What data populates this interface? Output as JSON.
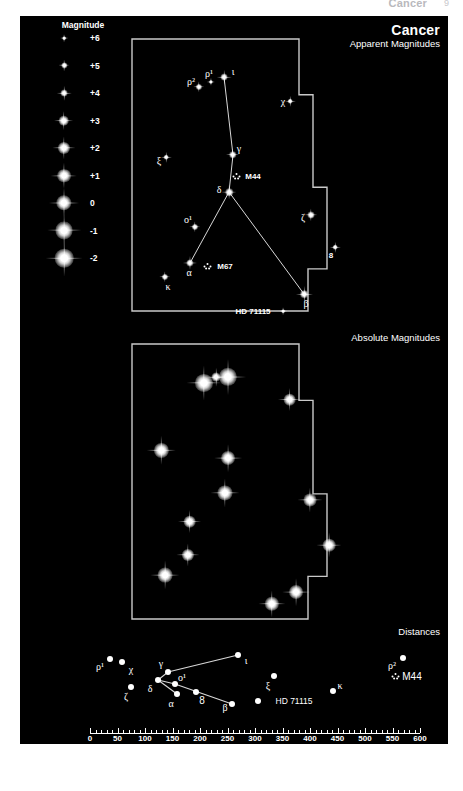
{
  "page_header": {
    "title": "Cancer",
    "page_number": "9"
  },
  "legend": {
    "title": "Magnitude",
    "rows": [
      {
        "label": "+6",
        "mag": 6
      },
      {
        "label": "+5",
        "mag": 5
      },
      {
        "label": "+4",
        "mag": 4
      },
      {
        "label": "+3",
        "mag": 3
      },
      {
        "label": "+2",
        "mag": 2
      },
      {
        "label": "+1",
        "mag": 1
      },
      {
        "label": "0",
        "mag": 0
      },
      {
        "label": "-1",
        "mag": -1
      },
      {
        "label": "-2",
        "mag": -2
      }
    ]
  },
  "titles": {
    "constellation": "Cancer",
    "panel_apparent": "Apparent Magnitudes",
    "panel_absolute": "Absolute Magnitudes",
    "panel_distances": "Distances"
  },
  "chart_data": {
    "type": "scatter",
    "title": "Cancer",
    "subtitle": "Apparent Magnitudes, Absolute Magnitudes and Distances",
    "panels": [
      {
        "name": "apparent_magnitudes",
        "title": "Apparent Magnitudes",
        "note": "Star symbol size encodes apparent magnitude; see Magnitude key.",
        "objects": [
          {
            "label": "ρ²",
            "kind": "star",
            "mag": 5.2,
            "x": 199,
            "y": 87,
            "lx": 191,
            "ly": 81
          },
          {
            "label": "ρ¹",
            "kind": "star",
            "mag": 5.9,
            "x": 211,
            "y": 82,
            "lx": 209,
            "ly": 73
          },
          {
            "label": "ι",
            "kind": "star",
            "mag": 4.0,
            "x": 224,
            "y": 77,
            "lx": 233,
            "ly": 71
          },
          {
            "label": "χ",
            "kind": "star",
            "mag": 5.1,
            "x": 290,
            "y": 101,
            "lx": 283,
            "ly": 101
          },
          {
            "label": "ξ",
            "kind": "star",
            "mag": 5.1,
            "x": 166,
            "y": 157,
            "lx": 159,
            "ly": 160
          },
          {
            "label": "γ",
            "kind": "star",
            "mag": 4.6,
            "x": 233,
            "y": 155,
            "lx": 239,
            "ly": 148
          },
          {
            "label": "M44",
            "kind": "cluster",
            "mag": 3.7,
            "x": 237,
            "y": 176,
            "lx": 253,
            "ly": 176
          },
          {
            "label": "δ",
            "kind": "star",
            "mag": 3.9,
            "x": 229,
            "y": 192,
            "lx": 219,
            "ly": 189
          },
          {
            "label": "ο¹",
            "kind": "star",
            "mag": 5.2,
            "x": 195,
            "y": 227,
            "lx": 188,
            "ly": 219
          },
          {
            "label": "ζ",
            "kind": "star",
            "mag": 4.7,
            "x": 311,
            "y": 215,
            "lx": 303,
            "ly": 217
          },
          {
            "label": "α",
            "kind": "star",
            "mag": 4.3,
            "x": 190,
            "y": 263,
            "lx": 189,
            "ly": 272
          },
          {
            "label": "M67",
            "kind": "cluster",
            "mag": 6.1,
            "x": 208,
            "y": 266,
            "lx": 225,
            "ly": 266
          },
          {
            "label": "8",
            "kind": "star",
            "mag": 5.1,
            "x": 335,
            "y": 247,
            "lx": 331,
            "ly": 255
          },
          {
            "label": "κ",
            "kind": "star",
            "mag": 5.2,
            "x": 165,
            "y": 277,
            "lx": 168,
            "ly": 286
          },
          {
            "label": "β",
            "kind": "star",
            "mag": 3.5,
            "x": 304,
            "y": 294,
            "lx": 306,
            "ly": 303
          },
          {
            "label": "HD 71115",
            "kind": "star",
            "mag": 6.0,
            "x": 283,
            "y": 311,
            "lx": 253,
            "ly": 311
          }
        ],
        "stick_figure": [
          [
            "ι",
            "γ"
          ],
          [
            "γ",
            "δ"
          ],
          [
            "δ",
            "α"
          ],
          [
            "δ",
            "β"
          ]
        ]
      },
      {
        "name": "absolute_magnitudes",
        "title": "Absolute Magnitudes",
        "note": "Same stars rendered at the brightness they would show at 32.6 ly; no labels drawn.",
        "objects": [
          {
            "label": "β",
            "mag": -1.2,
            "x": 204,
            "y": 383
          },
          {
            "label": "δ",
            "mag": -1.6,
            "x": 228,
            "y": 377
          },
          {
            "label": "ρ¹",
            "mag": 2.9,
            "x": 216,
            "y": 377
          },
          {
            "label": "χ",
            "mag": 1.9,
            "x": 290,
            "y": 400
          },
          {
            "label": "ξ",
            "mag": 0.2,
            "x": 161,
            "y": 450
          },
          {
            "label": "γ",
            "mag": 0.6,
            "x": 228,
            "y": 458
          },
          {
            "label": "α",
            "mag": 0.4,
            "x": 225,
            "y": 493
          },
          {
            "label": "ζ",
            "mag": 1.5,
            "x": 310,
            "y": 500
          },
          {
            "label": "ο¹",
            "mag": 1.9,
            "x": 190,
            "y": 522
          },
          {
            "label": "8",
            "mag": 1.2,
            "x": 329,
            "y": 545
          },
          {
            "label": "ρ²",
            "mag": 2.0,
            "x": 188,
            "y": 555
          },
          {
            "label": "κ",
            "mag": 0.1,
            "x": 165,
            "y": 575
          },
          {
            "label": "ι",
            "mag": 0.6,
            "x": 296,
            "y": 592
          },
          {
            "label": "HD 71115",
            "mag": 0.9,
            "x": 272,
            "y": 604
          }
        ]
      },
      {
        "name": "distances",
        "title": "Distances",
        "axis": {
          "label": "Distance (ly)",
          "min": 0,
          "max": 600,
          "major_step": 50,
          "minor_step": 10,
          "ticks": [
            "0",
            "50",
            "100",
            "150",
            "200",
            "250",
            "300",
            "350",
            "400",
            "450",
            "500",
            "550",
            "600"
          ]
        },
        "objects": [
          {
            "label": "ρ¹",
            "distance_ly": 50,
            "x": 110,
            "y": 659,
            "lx": 100,
            "ly": 666
          },
          {
            "label": "χ",
            "distance_ly": 59,
            "x": 122,
            "y": 662,
            "lx": 131,
            "ly": 669
          },
          {
            "label": "ζ",
            "distance_ly": 83,
            "x": 131,
            "y": 687,
            "lx": 126,
            "ly": 696
          },
          {
            "label": "δ",
            "distance_ly": 136,
            "x": 158,
            "y": 680,
            "lx": 150,
            "ly": 688
          },
          {
            "label": "γ",
            "distance_ly": 158,
            "x": 168,
            "y": 672,
            "lx": 161,
            "ly": 663
          },
          {
            "label": "ο¹",
            "distance_ly": 170,
            "x": 175,
            "y": 684,
            "lx": 182,
            "ly": 677
          },
          {
            "label": "α",
            "distance_ly": 174,
            "x": 177,
            "y": 694,
            "lx": 171,
            "ly": 703
          },
          {
            "label": "8",
            "distance_ly": 205,
            "x": 196,
            "y": 692,
            "lx": 202,
            "ly": 700
          },
          {
            "label": "ι",
            "distance_ly": 298,
            "x": 238,
            "y": 655,
            "lx": 246,
            "ly": 660
          },
          {
            "label": "β",
            "distance_ly": 290,
            "x": 232,
            "y": 704,
            "lx": 225,
            "ly": 707
          },
          {
            "label": "ξ",
            "distance_ly": 381,
            "x": 274,
            "y": 676,
            "lx": 268,
            "ly": 685
          },
          {
            "label": "HD 71115",
            "distance_ly": 410,
            "x": 258,
            "y": 701,
            "lx": 294,
            "ly": 701
          },
          {
            "label": "κ",
            "distance_ly": 470,
            "x": 333,
            "y": 691,
            "lx": 340,
            "ly": 685
          },
          {
            "label": "ρ²",
            "distance_ly": 560,
            "x": 403,
            "y": 658,
            "lx": 392,
            "ly": 665
          },
          {
            "label": "M44",
            "distance_ly": 577,
            "x": 396,
            "y": 676,
            "lx": 412,
            "ly": 676,
            "kind": "cluster"
          }
        ],
        "stick_figure": [
          [
            "δ",
            "γ"
          ],
          [
            "γ",
            "ι"
          ],
          [
            "δ",
            "ο¹"
          ],
          [
            "δ",
            "α"
          ],
          [
            "ο¹",
            "β"
          ]
        ]
      }
    ]
  },
  "colors": {
    "plate_background": "#000000",
    "star": "#ffffff",
    "boundary": "#c9c9c9",
    "stick_line": "#d8d8d8",
    "text": "#ffffff"
  }
}
